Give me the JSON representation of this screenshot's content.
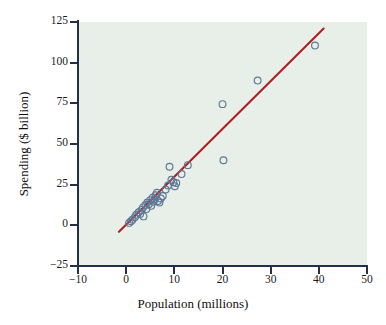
{
  "chart_data": {
    "type": "scatter",
    "title": "",
    "xlabel": "Population (millions)",
    "ylabel": "Spending ($ billion)",
    "xlim": [
      -10,
      50
    ],
    "ylim": [
      -25,
      125
    ],
    "xticks": [
      -10,
      0,
      10,
      20,
      30,
      40,
      50
    ],
    "yticks": [
      -25,
      0,
      25,
      50,
      75,
      100,
      125
    ],
    "xticklabels": [
      "−10",
      "0",
      "10",
      "20",
      "30",
      "40",
      "50"
    ],
    "yticklabels": [
      "−25",
      "0",
      "25",
      "50",
      "75",
      "100",
      "125"
    ],
    "grid": false,
    "legend": null,
    "marker": "open-circle",
    "marker_color": "#5d7794",
    "panel_color": "#e8efe8",
    "series": [
      {
        "name": "States",
        "points": [
          [
            0.6,
            1.5
          ],
          [
            1.0,
            2.5
          ],
          [
            1.3,
            3.5
          ],
          [
            1.8,
            5.0
          ],
          [
            2.1,
            6.5
          ],
          [
            2.6,
            8.0
          ],
          [
            2.9,
            7.0
          ],
          [
            3.2,
            9.5
          ],
          [
            3.5,
            11.0
          ],
          [
            3.6,
            5.5
          ],
          [
            4.0,
            12.5
          ],
          [
            4.2,
            10.0
          ],
          [
            4.4,
            14.0
          ],
          [
            4.7,
            13.0
          ],
          [
            5.0,
            15.5
          ],
          [
            5.2,
            12.0
          ],
          [
            5.5,
            17.0
          ],
          [
            5.7,
            14.5
          ],
          [
            5.9,
            16.0
          ],
          [
            6.1,
            18.5
          ],
          [
            6.4,
            20.0
          ],
          [
            6.6,
            15.0
          ],
          [
            6.9,
            14.0
          ],
          [
            7.2,
            16.5
          ],
          [
            7.6,
            18.0
          ],
          [
            8.2,
            22.0
          ],
          [
            8.7,
            24.5
          ],
          [
            9.0,
            36.0
          ],
          [
            9.4,
            28.0
          ],
          [
            9.8,
            26.5
          ],
          [
            10.1,
            24.0
          ],
          [
            10.4,
            26.0
          ],
          [
            11.5,
            31.5
          ],
          [
            12.8,
            37.0
          ],
          [
            20.0,
            74.5
          ],
          [
            20.2,
            40.0
          ],
          [
            27.3,
            89.0
          ],
          [
            39.2,
            110.5
          ]
        ]
      }
    ],
    "trendline": {
      "name": "least-squares regression line",
      "color": "#ad1f23",
      "x0": -1.5,
      "y0": -4.0,
      "x1": 41.0,
      "y1": 121.0
    }
  },
  "axes": {
    "x_title": "Population (millions)",
    "y_title": "Spending ($ billion)"
  }
}
